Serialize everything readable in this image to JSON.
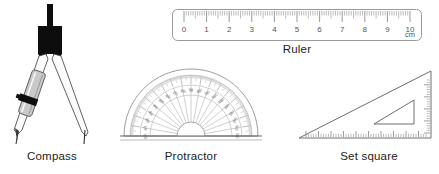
{
  "page": {
    "background_color": "#ffffff",
    "width": 439,
    "height": 174,
    "text_color": "#1c1c1c"
  },
  "items": [
    {
      "id": "compass",
      "caption": "Compass",
      "icon_name": "compass-icon",
      "colors": {
        "head": "#0d0d0d",
        "leg_outline": "#3a3a3a",
        "leg_fill": "#fdfdfd",
        "pencil_holder": "#c9c9c9",
        "clamp": "#0d0d0d"
      }
    },
    {
      "id": "ruler",
      "caption": "Ruler",
      "icon_name": "ruler-icon",
      "unit_label": "cm",
      "tick_labels": [
        "0",
        "1",
        "2",
        "3",
        "4",
        "5",
        "6",
        "7",
        "8",
        "9",
        "10"
      ],
      "min": 0,
      "max": 10,
      "minor_ticks_per_unit": 10,
      "colors": {
        "outline": "#9a9a9a",
        "ticks": "#8e8e8e",
        "numbers": "#555555",
        "body": "#ffffff"
      }
    },
    {
      "id": "protractor",
      "caption": "Protractor",
      "icon_name": "protractor-icon",
      "min_angle": 0,
      "max_angle": 180,
      "major_step": 10,
      "outer_scale_labels": [
        "0",
        "10",
        "20",
        "30",
        "40",
        "50",
        "60",
        "70",
        "80",
        "90",
        "100",
        "110",
        "120",
        "130",
        "140",
        "150",
        "160",
        "170",
        "180"
      ],
      "inner_scale_labels": [
        "180",
        "170",
        "160",
        "150",
        "140",
        "130",
        "120",
        "110",
        "100",
        "90",
        "80",
        "70",
        "60",
        "50",
        "40",
        "30",
        "20",
        "10",
        "0"
      ],
      "colors": {
        "outline": "#9e9e9e",
        "ticks": "#a8a8a8",
        "numbers": "#7a7a7a",
        "baseline": "#555555",
        "body": "#ffffff"
      }
    },
    {
      "id": "set-square",
      "caption": "Set square",
      "icon_name": "set-square-icon",
      "shape": "right-triangle",
      "colors": {
        "outline": "#6e6e6e",
        "ticks": "#7d7d7d",
        "body": "#ffffff"
      }
    }
  ]
}
